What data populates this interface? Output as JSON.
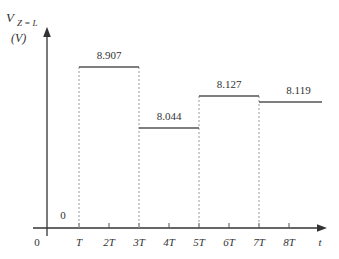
{
  "chart_data": {
    "type": "line",
    "subtype": "step",
    "title": "",
    "ylabel_main": "V",
    "ylabel_sub": "Z = L",
    "ylabel_unit": "(V)",
    "xlabel": "t",
    "origin_label": "0",
    "x_ticks": [
      "T",
      "2T",
      "3T",
      "4T",
      "5T",
      "6T",
      "7T",
      "8T"
    ],
    "segments": [
      {
        "from": "0",
        "to": "T",
        "value": 0,
        "label": "0"
      },
      {
        "from": "T",
        "to": "3T",
        "value": 8.907,
        "label": "8.907"
      },
      {
        "from": "3T",
        "to": "5T",
        "value": 8.044,
        "label": "8.044"
      },
      {
        "from": "5T",
        "to": "7T",
        "value": 8.127,
        "label": "8.127"
      },
      {
        "from": "7T",
        "to": "8T+",
        "value": 8.119,
        "label": "8.119"
      }
    ],
    "grid": false,
    "legend": "none"
  }
}
